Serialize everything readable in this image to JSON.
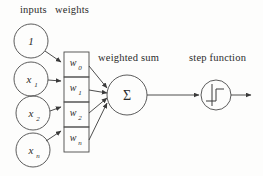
{
  "figure": {
    "background_color": "#fdfdfc",
    "stroke_color": "#3a3a3a",
    "text_color": "#2b2b2b"
  },
  "labels": {
    "inputs": "inputs",
    "weights": "weights",
    "weighted_sum": "weighted sum",
    "step_function": "step function"
  },
  "inputs": [
    {
      "label": "1",
      "sub": ""
    },
    {
      "label": "x",
      "sub": "1"
    },
    {
      "label": "x",
      "sub": "2"
    },
    {
      "label": "x",
      "sub": "n"
    }
  ],
  "weights": [
    {
      "label": "w",
      "sub": "0"
    },
    {
      "label": "w",
      "sub": "1"
    },
    {
      "label": "w",
      "sub": "2"
    },
    {
      "label": "w",
      "sub": "n"
    }
  ],
  "sum_node": {
    "symbol": "Σ"
  },
  "activation_node": {
    "name": "step-function-glyph"
  }
}
